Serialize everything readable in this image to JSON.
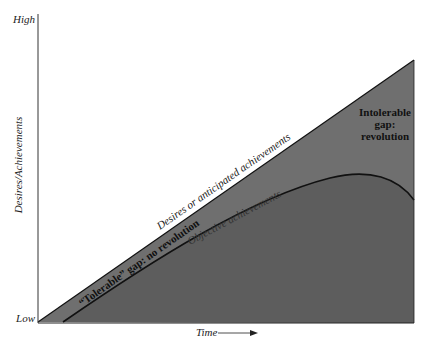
{
  "diagram": {
    "axes": {
      "y_label": "Desires/Achievements",
      "y_high": "High",
      "y_low": "Low",
      "x_label": "Time"
    },
    "lines": {
      "desires": "Desires or anticipated achievements",
      "objective": "Objective achievements"
    },
    "regions": {
      "tolerable_gap": "“Tolerable” gap: no revolution",
      "intolerable_gap_line1": "Intolerable",
      "intolerable_gap_line2": "gap:",
      "intolerable_gap_line3": "revolution"
    },
    "colors": {
      "gap_fill": "#6e6e6e",
      "achievement_fill": "#5a5a5a",
      "line": "#111111",
      "background": "#ffffff"
    }
  }
}
